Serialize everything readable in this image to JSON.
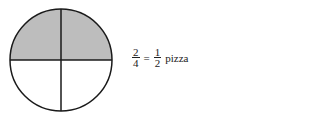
{
  "diagram": {
    "shape": "circle",
    "total_parts": 4,
    "shaded_parts": 2,
    "shaded_region": "top half",
    "colors": {
      "shade": "#bdbdbd",
      "stroke": "#1a1a1a",
      "background": "#ffffff"
    }
  },
  "equation": {
    "left": {
      "numerator": "2",
      "denominator": "4"
    },
    "operator": "=",
    "right": {
      "numerator": "1",
      "denominator": "2"
    },
    "unit": "pizza"
  }
}
